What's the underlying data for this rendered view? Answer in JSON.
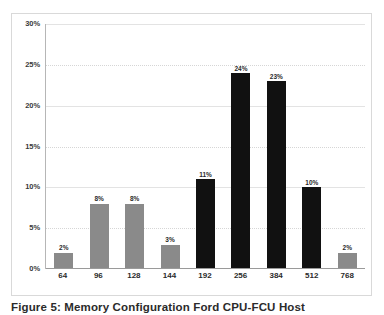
{
  "chart_data": {
    "type": "bar",
    "title": "",
    "xlabel": "",
    "ylabel": "",
    "categories": [
      "64",
      "96",
      "128",
      "144",
      "192",
      "256",
      "384",
      "512",
      "768"
    ],
    "values": [
      2,
      8,
      8,
      3,
      11,
      24,
      23,
      10,
      2
    ],
    "value_labels": [
      "2%",
      "8%",
      "8%",
      "3%",
      "11%",
      "24%",
      "23%",
      "10%",
      "2%"
    ],
    "bar_colors": [
      "#8a8a8a",
      "#8a8a8a",
      "#8a8a8a",
      "#8a8a8a",
      "#111111",
      "#111111",
      "#111111",
      "#111111",
      "#8a8a8a"
    ],
    "ylim": [
      0,
      30
    ],
    "ytick_values": [
      30,
      25,
      20,
      15,
      10,
      5,
      0
    ],
    "ytick_labels": [
      "30%",
      "25%",
      "20%",
      "15%",
      "10%",
      "5%",
      "0%"
    ],
    "grid": true,
    "grid_axis": "y",
    "legend": false,
    "legend_position": "none"
  },
  "figure": {
    "caption": "Figure 5: Memory Configuration Ford CPU-FCU Host"
  },
  "colors": {
    "bar_gray": "#8a8a8a",
    "bar_dark": "#111111",
    "gridline": "#d6d6d6",
    "axis": "#b6b6b6",
    "frame": "#d9d9d9",
    "text": "#2b2b2b",
    "background": "#ffffff"
  }
}
